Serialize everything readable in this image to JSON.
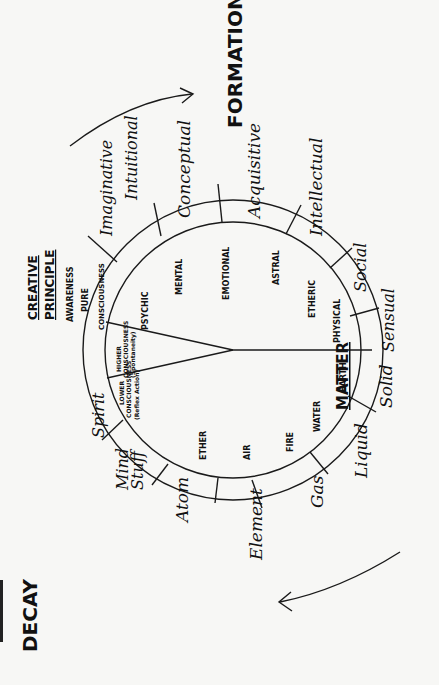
{
  "diagram": {
    "directions": {
      "formation": "FORMATION",
      "decay": "DECAY",
      "matter": "MATTER",
      "creative_principle_line1": "CREATIVE",
      "creative_principle_line2": "PRINCIPLE"
    },
    "center_wedge": {
      "awareness": "AWARENESS",
      "pure": "PURE",
      "consciousness": "CONSCIOUSNESS",
      "higher_1": "HIGHER",
      "higher_2": "CONSCIOUSNESS",
      "higher_3": "(Spontaneity)",
      "lower_1": "LOWER",
      "lower_2": "CONSCIOUSNESS",
      "lower_3": "(Reflex Action)"
    },
    "inner_ring": {
      "psychic": "PSYCHIC",
      "mental": "MENTAL",
      "emotional": "EMOTIONAL",
      "astral": "ASTRAL",
      "etheric": "ETHERIC",
      "physical": "PHYSICAL",
      "earth": "EARTH",
      "water": "WATER",
      "fire": "FIRE",
      "air": "AIR",
      "ether": "ETHER"
    },
    "outer_labels": {
      "imaginative": "Imaginative",
      "intuitional": "Intuitional",
      "conceptual": "Conceptual",
      "acquisitive": "Acquisitive",
      "intellectual": "Intellectual",
      "social": "Social",
      "sensual": "Sensual",
      "solid": "Solid",
      "liquid": "Liquid",
      "gas": "Gas",
      "element": "Element",
      "atom": "Atom",
      "mind_stuff_1": "Mind",
      "mind_stuff_2": "Stuff",
      "spirit": "Spirit"
    },
    "colors": {
      "ink": "#111111",
      "paper": "#f7f7f5"
    }
  }
}
